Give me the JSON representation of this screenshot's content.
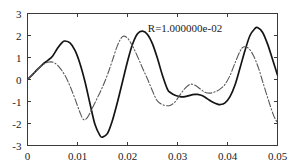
{
  "chart_data": {
    "type": "line",
    "title": "",
    "xlabel": "",
    "ylabel": "",
    "xlim": [
      0,
      0.05
    ],
    "ylim": [
      -3,
      3
    ],
    "grid": false,
    "legend": null,
    "xticks": [
      0,
      0.01,
      0.02,
      0.03,
      0.04,
      0.05
    ],
    "xtick_labels": [
      "0",
      "0.01",
      "0.02",
      "0.03",
      "0.04",
      "0.05"
    ],
    "yticks": [
      -3,
      -2,
      -1,
      0,
      1,
      2,
      3
    ],
    "ytick_labels": [
      "-3",
      "-2",
      "-1",
      "0",
      "1",
      "2",
      "3"
    ],
    "annotations": [
      {
        "text": "R=1.000000e-02",
        "x": 0.0315,
        "y": 2.15
      }
    ],
    "series": [
      {
        "name": "solid-curve",
        "style": "solid",
        "color": "#141414",
        "x": [
          0.0,
          0.001,
          0.002,
          0.003,
          0.004,
          0.005,
          0.006,
          0.007,
          0.0075,
          0.0085,
          0.0095,
          0.0105,
          0.0115,
          0.0125,
          0.0135,
          0.0145,
          0.015,
          0.016,
          0.017,
          0.018,
          0.019,
          0.02,
          0.021,
          0.022,
          0.023,
          0.024,
          0.025,
          0.026,
          0.027,
          0.028,
          0.0285,
          0.0295,
          0.0305,
          0.0315,
          0.0325,
          0.0335,
          0.034,
          0.035,
          0.036,
          0.037,
          0.038,
          0.0385,
          0.0395,
          0.0405,
          0.0415,
          0.0425,
          0.0435,
          0.0445,
          0.0455,
          0.046,
          0.047,
          0.048,
          0.049,
          0.05
        ],
        "y": [
          0.0,
          0.22,
          0.46,
          0.68,
          0.86,
          1.06,
          1.42,
          1.7,
          1.75,
          1.66,
          1.32,
          0.72,
          -0.1,
          -1.1,
          -2.05,
          -2.55,
          -2.62,
          -2.45,
          -1.85,
          -1.02,
          -0.1,
          0.82,
          1.6,
          2.08,
          2.2,
          2.05,
          1.62,
          0.95,
          0.18,
          -0.45,
          -0.58,
          -0.72,
          -0.78,
          -0.78,
          -0.72,
          -0.68,
          -0.68,
          -0.74,
          -0.88,
          -1.02,
          -1.12,
          -1.14,
          -1.06,
          -0.78,
          -0.25,
          0.52,
          1.32,
          2.0,
          2.32,
          2.36,
          2.15,
          1.62,
          0.92,
          0.2
        ]
      },
      {
        "name": "dash-dot-curve",
        "style": "dashdot",
        "color": "#585858",
        "x": [
          0.0,
          0.001,
          0.002,
          0.003,
          0.004,
          0.0048,
          0.0055,
          0.0065,
          0.0075,
          0.0085,
          0.0095,
          0.0105,
          0.0112,
          0.012,
          0.013,
          0.014,
          0.015,
          0.016,
          0.017,
          0.018,
          0.019,
          0.02,
          0.021,
          0.022,
          0.023,
          0.024,
          0.025,
          0.0258,
          0.0265,
          0.0275,
          0.0285,
          0.0295,
          0.0305,
          0.0315,
          0.0325,
          0.0335,
          0.0345,
          0.0355,
          0.0365,
          0.0375,
          0.0385,
          0.0395,
          0.0405,
          0.0415,
          0.0425,
          0.0432,
          0.0442,
          0.0452,
          0.0462,
          0.0472,
          0.0482,
          0.0492,
          0.05
        ],
        "y": [
          0.0,
          0.22,
          0.46,
          0.66,
          0.78,
          0.8,
          0.74,
          0.52,
          0.18,
          -0.3,
          -0.88,
          -1.5,
          -1.82,
          -1.72,
          -1.28,
          -0.82,
          -0.34,
          0.22,
          0.88,
          1.55,
          1.95,
          1.88,
          1.52,
          1.05,
          0.52,
          0.02,
          -0.52,
          -0.92,
          -1.08,
          -1.18,
          -1.18,
          -1.02,
          -0.7,
          -0.4,
          -0.22,
          -0.26,
          -0.42,
          -0.58,
          -0.62,
          -0.56,
          -0.44,
          -0.22,
          0.18,
          0.75,
          1.28,
          1.48,
          1.42,
          1.08,
          0.52,
          -0.22,
          -0.95,
          -1.62,
          -1.98
        ]
      }
    ]
  },
  "figure": {
    "background_color": "#ffffff",
    "axis_color": "#3a3a3a",
    "text_color": "#1a1a1a"
  }
}
